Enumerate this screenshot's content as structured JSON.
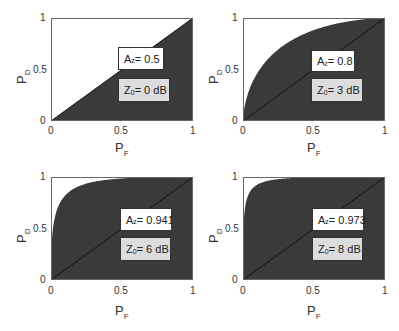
{
  "chart_data": [
    {
      "type": "area",
      "title": "",
      "xlabel": "P_F",
      "ylabel": "P_D",
      "xlim": [
        0,
        1
      ],
      "ylim": [
        0,
        1
      ],
      "xticks": [
        "0",
        "0.5",
        "1"
      ],
      "yticks": [
        "0",
        "0.5",
        "1"
      ],
      "grid": false,
      "series": [
        {
          "name": "ROC",
          "d_prime": 0,
          "x": [
            0,
            0.25,
            0.5,
            0.75,
            1
          ],
          "y": [
            0,
            0.25,
            0.5,
            0.75,
            1
          ]
        },
        {
          "name": "chance",
          "x": [
            0,
            1
          ],
          "y": [
            0,
            1
          ]
        }
      ],
      "annotations": {
        "az": "0.5",
        "z0": "0 dB"
      }
    },
    {
      "type": "area",
      "title": "",
      "xlabel": "P_F",
      "ylabel": "P_D",
      "xlim": [
        0,
        1
      ],
      "ylim": [
        0,
        1
      ],
      "xticks": [
        "0",
        "0.5",
        "1"
      ],
      "yticks": [
        "0",
        "0.5",
        "1"
      ],
      "grid": false,
      "series": [
        {
          "name": "ROC",
          "d_prime": 1.19,
          "x": [
            0,
            0.05,
            0.1,
            0.25,
            0.5,
            0.75,
            1
          ],
          "y": [
            0.25,
            0.45,
            0.56,
            0.71,
            0.85,
            0.94,
            1
          ]
        },
        {
          "name": "chance",
          "x": [
            0,
            1
          ],
          "y": [
            0,
            1
          ]
        }
      ],
      "annotations": {
        "az": "0.8",
        "z0": "3 dB"
      }
    },
    {
      "type": "area",
      "title": "",
      "xlabel": "P_F",
      "ylabel": "P_D",
      "xlim": [
        0,
        1
      ],
      "ylim": [
        0,
        1
      ],
      "xticks": [
        "0",
        "0.5",
        "1"
      ],
      "yticks": [
        "0",
        "0.5",
        "1"
      ],
      "grid": false,
      "series": [
        {
          "name": "ROC",
          "d_prime": 2.2,
          "x": [
            0,
            0.05,
            0.1,
            0.25,
            0.5,
            0.75,
            1
          ],
          "y": [
            0.75,
            0.8,
            0.86,
            0.93,
            0.97,
            0.99,
            1
          ]
        },
        {
          "name": "chance",
          "x": [
            0,
            1
          ],
          "y": [
            0,
            1
          ]
        }
      ],
      "annotations": {
        "az": "0.941",
        "z0": "6 dB"
      }
    },
    {
      "type": "area",
      "title": "",
      "xlabel": "P_F",
      "ylabel": "P_D",
      "xlim": [
        0,
        1
      ],
      "ylim": [
        0,
        1
      ],
      "xticks": [
        "0",
        "0.5",
        "1"
      ],
      "yticks": [
        "0",
        "0.5",
        "1"
      ],
      "grid": false,
      "series": [
        {
          "name": "ROC",
          "d_prime": 2.72,
          "x": [
            0,
            0.05,
            0.1,
            0.25,
            0.5,
            0.75,
            1
          ],
          "y": [
            0.88,
            0.92,
            0.95,
            0.97,
            0.99,
            0.997,
            1
          ]
        },
        {
          "name": "chance",
          "x": [
            0,
            1
          ],
          "y": [
            0,
            1
          ]
        }
      ],
      "annotations": {
        "az": "0.973",
        "z0": "8 dB"
      }
    }
  ],
  "panels": [
    {
      "az_label": "A",
      "az_sub": "z",
      "az_value": " = 0.5",
      "z0_label": "Z",
      "z0_sub": "0",
      "z0_value": " = 0 dB",
      "xlabel": "P",
      "xsub": "F",
      "ylabel": "P",
      "ysub": "D",
      "t0": "0",
      "t05": "0.5",
      "t1": "1"
    },
    {
      "az_label": "A",
      "az_sub": "z",
      "az_value": " = 0.8",
      "z0_label": "Z",
      "z0_sub": "0",
      "z0_value": " = 3 dB",
      "xlabel": "P",
      "xsub": "F",
      "ylabel": "P",
      "ysub": "D",
      "t0": "0",
      "t05": "0.5",
      "t1": "1"
    },
    {
      "az_label": "A",
      "az_sub": "z",
      "az_value": " = 0.941",
      "z0_label": "Z",
      "z0_sub": "0",
      "z0_value": " = 6 dB",
      "xlabel": "P",
      "xsub": "F",
      "ylabel": "P",
      "ysub": "D",
      "t0": "0",
      "t05": "0.5",
      "t1": "1"
    },
    {
      "az_label": "A",
      "az_sub": "z",
      "az_value": " = 0.973",
      "z0_label": "Z",
      "z0_sub": "0",
      "z0_value": " = 8 dB",
      "xlabel": "P",
      "xsub": "F",
      "ylabel": "P",
      "ysub": "D",
      "t0": "0",
      "t05": "0.5",
      "t1": "1"
    }
  ],
  "colors": {
    "fill": "#3a3a3a",
    "axis": "#666666",
    "line": "#111111"
  }
}
